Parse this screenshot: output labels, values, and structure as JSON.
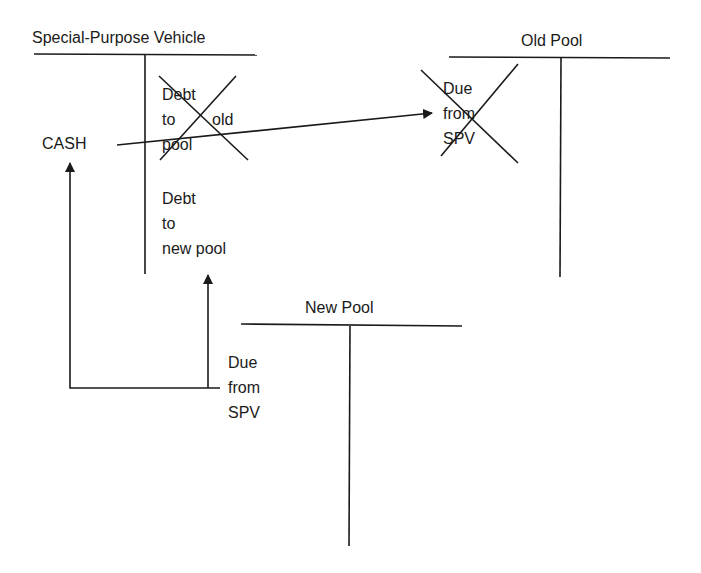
{
  "diagram": {
    "type": "t-account-flow",
    "accounts": {
      "spv": {
        "title": "Special-Purpose Vehicle",
        "debit_entries": [
          "CASH"
        ],
        "credit_entries": [
          {
            "lines": [
              "Debt",
              "to",
              "old",
              "pool"
            ],
            "crossed_out": true
          },
          {
            "lines": [
              "Debt",
              "to",
              "new pool"
            ],
            "crossed_out": false
          }
        ]
      },
      "old_pool": {
        "title": "Old Pool",
        "debit_entries": [
          {
            "lines": [
              "Due",
              "from",
              "SPV"
            ],
            "crossed_out": true
          }
        ]
      },
      "new_pool": {
        "title": "New Pool",
        "debit_entries": [
          {
            "lines": [
              "Due",
              "from",
              "SPV"
            ],
            "crossed_out": false
          }
        ]
      }
    },
    "arrows": [
      {
        "from": "CASH",
        "to": "Old Pool: Due from SPV"
      },
      {
        "from": "New Pool: Due from SPV",
        "to": "CASH"
      },
      {
        "from": "New Pool: Due from SPV",
        "to": "SPV: Debt to new pool"
      }
    ],
    "colors": {
      "ink": "#1a1a1a",
      "background": "#ffffff"
    }
  }
}
